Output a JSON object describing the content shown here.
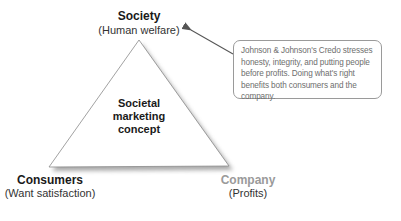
{
  "diagram": {
    "type": "triangle",
    "center_label": [
      "Societal",
      "marketing",
      "concept"
    ],
    "vertices": {
      "top": {
        "title": "Society",
        "subtitle": "(Human welfare)"
      },
      "bottom_left": {
        "title": "Consumers",
        "subtitle": "(Want satisfaction)"
      },
      "bottom_right": {
        "title": "Company",
        "subtitle": "(Profits)"
      }
    },
    "callout": {
      "text": "Johnson & Johnson's Credo stresses honesty, integrity, and putting people before profits.  Doing what's right benefits both consumers and the company."
    },
    "colors": {
      "triangle_stroke": "#8a8a8a",
      "shadow": "#9a9a9a",
      "company_title": "#9a9a9a",
      "callout_text": "#6e6e6e",
      "arrow": "#555555"
    }
  }
}
